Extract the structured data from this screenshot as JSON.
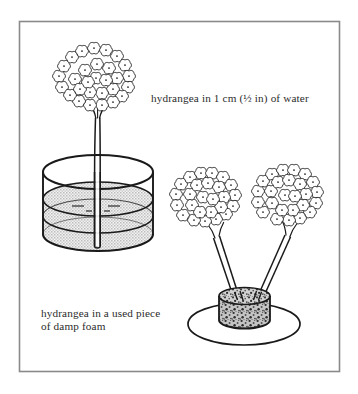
{
  "figure": {
    "frame": {
      "border_color": "#8a8a8a",
      "background_color": "#ffffff"
    },
    "captions": [
      {
        "id": "water",
        "name": "caption-water",
        "text": "hydrangea in 1 cm (½ in) of water",
        "lines": [
          "hydrangea in 1 cm (½ in) of water"
        ],
        "prefix": "hydrangea in ",
        "figure": "1",
        "suffix": " cm (½ in) of water"
      },
      {
        "id": "foam",
        "name": "caption-foam",
        "text": "hydrangea in a used piece of damp foam",
        "line1": "hydrangea in a used piece",
        "line2": "of damp foam"
      }
    ],
    "objects": [
      {
        "name": "glass-vase-of-water",
        "label": "cylindrical glass vase",
        "fill": "#d9d9d9",
        "outline": "#1a1a1a",
        "contents": "water",
        "water_depth": "1 cm (½ in)",
        "stems": 1
      },
      {
        "name": "floral-foam-block",
        "label": "used piece of damp foam",
        "fill": "#9a9a9a",
        "outline": "#1a1a1a",
        "texture": "speckled",
        "stems": 2
      },
      {
        "name": "saucer-plate",
        "label": "shallow plate",
        "fill": "#ffffff",
        "outline": "#1a1a1a"
      },
      {
        "name": "hydrangea-bloom-left",
        "label": "hydrangea flower head in water"
      },
      {
        "name": "hydrangea-bloom-foam-left",
        "label": "hydrangea flower head in foam (left)"
      },
      {
        "name": "hydrangea-bloom-foam-right",
        "label": "hydrangea flower head in foam (right)"
      }
    ],
    "colors": {
      "ink": "#1a1a1a",
      "text": "#2b2b2b",
      "water": "#d9d9d9",
      "foam": "#9a9a9a",
      "frame": "#8a8a8a",
      "paper": "#ffffff"
    }
  }
}
